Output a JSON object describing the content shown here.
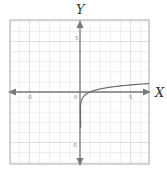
{
  "chart_data": {
    "type": "line",
    "title": "",
    "xlabel": "X",
    "ylabel": "Y",
    "xlim": [
      -7,
      7
    ],
    "ylim": [
      -7,
      7
    ],
    "grid": true,
    "grid_step": 1,
    "x_ticks": [
      {
        "value": -5,
        "label": "-5"
      },
      {
        "value": 0,
        "label": "0"
      },
      {
        "value": 5,
        "label": "5"
      }
    ],
    "y_ticks": [
      {
        "value": 5,
        "label": "5"
      },
      {
        "value": -5,
        "label": "-5"
      }
    ],
    "series": [
      {
        "name": "y = log10(x)",
        "function": "log10(x)",
        "x": [
          0.05,
          0.1,
          0.2,
          0.5,
          1,
          2,
          3,
          4,
          5,
          6,
          7
        ],
        "values": [
          -1.3,
          -1.0,
          -0.7,
          -0.3,
          0.0,
          0.3,
          0.48,
          0.6,
          0.7,
          0.78,
          0.85
        ]
      }
    ],
    "legend": "none"
  },
  "axes": {
    "x_label": "X",
    "y_label": "Y",
    "origin_label": "0",
    "x_tick_neg": "-5",
    "x_tick_pos": "5",
    "y_tick_pos": "5",
    "y_tick_neg": "-5"
  },
  "colors": {
    "grid": "#dcdcdc",
    "frame": "#a8a8a8",
    "axis": "#7a7a7a",
    "curve": "#6a6a6a"
  }
}
